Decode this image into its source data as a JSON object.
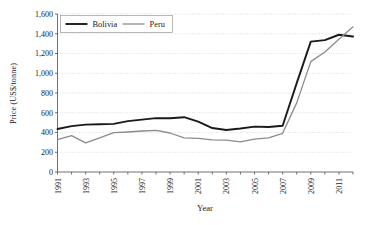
{
  "figure": {
    "name": "line-chart-mineral-price-bolivia-peru",
    "background": "#ffffff"
  },
  "axes": {
    "ylabel": "Price (US$/tonne)",
    "xlabel": "Year",
    "y_ticks": [
      "0",
      "200",
      "400",
      "600",
      "800",
      "1,000",
      "1,200",
      "1,400",
      "1,600"
    ],
    "x_ticks": [
      "1991",
      "1993",
      "1995",
      "1997",
      "1999",
      "2001",
      "2003",
      "2005",
      "2007",
      "2009",
      "2011"
    ]
  },
  "legend": {
    "items": [
      {
        "label": "Bolivia",
        "color": "#1a1a1a"
      },
      {
        "label": "Peru",
        "color": "#8c8c8c"
      }
    ]
  },
  "chart_data": {
    "type": "line",
    "title": "",
    "xlabel": "Year",
    "ylabel": "Price (US$/tonne)",
    "xlim": [
      1991,
      2012
    ],
    "ylim": [
      0,
      1600
    ],
    "ytick_step": 200,
    "grid": "horizontal-dotted",
    "legend_position": "top-left-inside",
    "x": [
      1991,
      1992,
      1993,
      1994,
      1995,
      1996,
      1997,
      1998,
      1999,
      2000,
      2001,
      2002,
      2003,
      2004,
      2005,
      2006,
      2007,
      2008,
      2009,
      2010,
      2011,
      2012
    ],
    "series": [
      {
        "name": "Bolivia",
        "color": "#1a1a1a",
        "width": 1.9,
        "values": [
          435,
          465,
          480,
          483,
          487,
          515,
          530,
          545,
          545,
          555,
          510,
          445,
          425,
          440,
          460,
          455,
          468,
          900,
          1320,
          1335,
          1390,
          1372
        ]
      },
      {
        "name": "Peru",
        "color": "#8c8c8c",
        "width": 1.3,
        "values": [
          328,
          368,
          295,
          345,
          398,
          405,
          415,
          422,
          395,
          345,
          340,
          325,
          322,
          305,
          332,
          345,
          392,
          700,
          1118,
          1215,
          1345,
          1470
        ]
      }
    ]
  }
}
